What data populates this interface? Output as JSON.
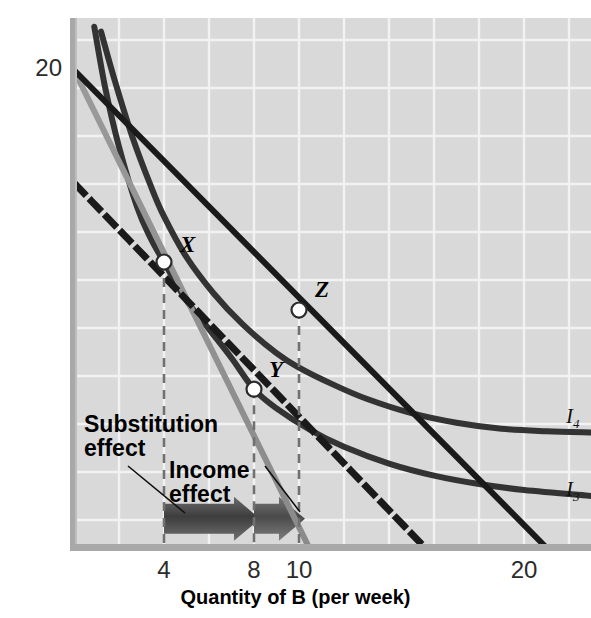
{
  "figure": {
    "bg_plot": "#d9d9d9",
    "grid_color": "#f2f2f2",
    "axis_color": "#a8a8a8"
  },
  "axes": {
    "x": {
      "label": "Quantity of B (per week)",
      "ticks": [
        {
          "value": 4,
          "text": "4"
        },
        {
          "value": 8,
          "text": "8"
        },
        {
          "value": 10,
          "text": "10"
        },
        {
          "value": 20,
          "text": "20"
        }
      ],
      "range": [
        0,
        23
      ]
    },
    "y": {
      "label": "Quantity of A (per week)",
      "ticks": [
        {
          "value": 20,
          "text": "20"
        }
      ],
      "range": [
        0,
        22.2
      ]
    }
  },
  "annotations": [
    {
      "name": "substitution-effect-label",
      "text": "Substitution\neffect"
    },
    {
      "name": "income-effect-label",
      "text": "Income\neffect"
    }
  ],
  "points": [
    {
      "name": "point-x",
      "label": "X",
      "x": 4,
      "y": 12.0
    },
    {
      "name": "point-y",
      "label": "Y",
      "x": 8,
      "y": 6.7
    },
    {
      "name": "point-z",
      "label": "Z",
      "x": 10,
      "y": 10.0
    }
  ],
  "curve_labels": [
    {
      "name": "curve-label-i4",
      "base": "I",
      "sub": "4"
    },
    {
      "name": "curve-label-i3",
      "base": "I",
      "sub": "3"
    }
  ],
  "chart_data": {
    "type": "line",
    "xlabel": "Quantity of B (per week)",
    "ylabel": "Quantity of A (per week)",
    "xlim": [
      0,
      23
    ],
    "ylim": [
      0,
      22.2
    ],
    "xticks": [
      4,
      8,
      10,
      20
    ],
    "yticks": [
      20
    ],
    "grid": true,
    "legend": "none",
    "series": [
      {
        "name": "I4",
        "role": "indifference-curve-higher",
        "color": "#333333",
        "style": "solid",
        "width": 6,
        "points": [
          [
            1.2,
            21.6
          ],
          [
            1.8,
            19.6
          ],
          [
            2.6,
            17.2
          ],
          [
            3.4,
            15.2
          ],
          [
            4.0,
            13.9
          ],
          [
            5.0,
            12.2
          ],
          [
            6.2,
            10.7
          ],
          [
            7.5,
            9.4
          ],
          [
            9.0,
            8.2
          ],
          [
            10.0,
            7.6
          ],
          [
            11.5,
            6.9
          ],
          [
            13.0,
            6.3
          ],
          [
            15.0,
            5.7
          ],
          [
            17.0,
            5.3
          ],
          [
            19.0,
            5.05
          ],
          [
            21.0,
            4.95
          ],
          [
            23.0,
            4.9
          ]
        ]
      },
      {
        "name": "I3",
        "role": "indifference-curve-lower",
        "color": "#333333",
        "style": "solid",
        "width": 6,
        "points": [
          [
            0.9,
            21.8
          ],
          [
            1.4,
            19.2
          ],
          [
            2.0,
            16.8
          ],
          [
            2.8,
            14.3
          ],
          [
            3.4,
            13.0
          ],
          [
            4.0,
            12.0
          ],
          [
            5.0,
            10.4
          ],
          [
            6.0,
            9.2
          ],
          [
            7.0,
            8.0
          ],
          [
            8.0,
            6.7
          ],
          [
            9.0,
            5.9
          ],
          [
            10.5,
            5.0
          ],
          [
            12.0,
            4.3
          ],
          [
            14.0,
            3.6
          ],
          [
            16.0,
            3.1
          ],
          [
            18.0,
            2.75
          ],
          [
            20.0,
            2.5
          ],
          [
            23.0,
            2.25
          ]
        ]
      },
      {
        "name": "budget-line-original",
        "role": "budget-line-initial",
        "color": "#8c8c8c",
        "style": "solid",
        "width": 6,
        "points": [
          [
            0,
            20
          ],
          [
            10.5,
            0
          ]
        ]
      },
      {
        "name": "budget-line-new",
        "role": "budget-line-after-price-change",
        "color": "#1a1a1a",
        "style": "solid",
        "width": 6,
        "points": [
          [
            0,
            20
          ],
          [
            21.1,
            0
          ]
        ]
      },
      {
        "name": "budget-line-compensated",
        "role": "hypothetical-compensated-budget-line",
        "color": "#1a1a1a",
        "style": "dashed",
        "width": 7,
        "points": [
          [
            0.1,
            15.2
          ],
          [
            15.7,
            0
          ]
        ]
      }
    ],
    "effect_arrows": [
      {
        "name": "substitution-effect-arrow",
        "from_x": 4,
        "to_x": 8,
        "y": 1.3,
        "color": "#4d4d4d"
      },
      {
        "name": "income-effect-arrow",
        "from_x": 8,
        "to_x": 10,
        "y": 1.3,
        "color": "#595959"
      }
    ],
    "drop_lines": [
      {
        "name": "drop-line-x",
        "x": 4,
        "from_y": 12.0,
        "to_y": 0
      },
      {
        "name": "drop-line-y",
        "x": 8,
        "from_y": 6.7,
        "to_y": 0
      },
      {
        "name": "drop-line-z",
        "x": 10,
        "from_y": 10.0,
        "to_y": 0
      }
    ]
  }
}
